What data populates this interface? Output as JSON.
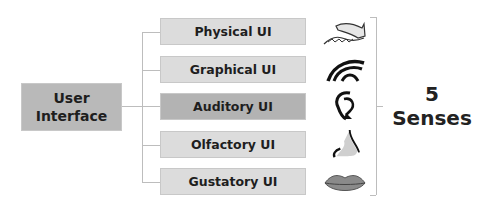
{
  "root": {
    "line1": "User",
    "line2": "Interface"
  },
  "branches": [
    {
      "label": "Physical UI",
      "icon": "hand-touch-icon"
    },
    {
      "label": "Graphical UI",
      "icon": "eye-icon"
    },
    {
      "label": "Auditory UI",
      "icon": "ear-icon",
      "highlighted": true
    },
    {
      "label": "Olfactory UI",
      "icon": "nose-icon"
    },
    {
      "label": "Gustatory UI",
      "icon": "lips-icon"
    }
  ],
  "summary": {
    "count": "5",
    "label": "Senses"
  },
  "colors": {
    "root_fill": "#b9b9b9",
    "leaf_fill": "#dcdcdc",
    "highlight_fill": "#b3b3b3",
    "connector": "#bdbdbd"
  }
}
